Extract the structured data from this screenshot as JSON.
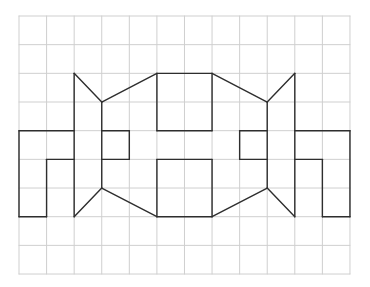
{
  "grid": {
    "cols": 12,
    "rows": 9,
    "origin_px": [
      19,
      16
    ],
    "cell_px": [
      27.58,
      28.67
    ],
    "line_color": "#cfcfcf",
    "line_width": 1
  },
  "figure": {
    "stroke_color": "#2e2e2e",
    "stroke_width": 1.4,
    "segments": [
      [
        [
          0,
          4
        ],
        [
          2,
          4
        ]
      ],
      [
        [
          0,
          4
        ],
        [
          0,
          7
        ]
      ],
      [
        [
          0,
          7
        ],
        [
          1,
          7
        ]
      ],
      [
        [
          1,
          5
        ],
        [
          1,
          7
        ]
      ],
      [
        [
          1,
          5
        ],
        [
          2,
          5
        ]
      ],
      [
        [
          2,
          2
        ],
        [
          2,
          7
        ]
      ],
      [
        [
          2,
          2
        ],
        [
          3,
          3
        ]
      ],
      [
        [
          3,
          3
        ],
        [
          3,
          6
        ]
      ],
      [
        [
          3,
          6
        ],
        [
          2,
          7
        ]
      ],
      [
        [
          3,
          4
        ],
        [
          4,
          4
        ]
      ],
      [
        [
          4,
          4
        ],
        [
          4,
          5
        ]
      ],
      [
        [
          4,
          5
        ],
        [
          3,
          5
        ]
      ],
      [
        [
          3,
          3
        ],
        [
          5,
          2
        ]
      ],
      [
        [
          3,
          6
        ],
        [
          5,
          7
        ]
      ],
      [
        [
          5,
          2
        ],
        [
          7,
          2
        ]
      ],
      [
        [
          5,
          2
        ],
        [
          5,
          4
        ]
      ],
      [
        [
          5,
          4
        ],
        [
          7,
          4
        ]
      ],
      [
        [
          7,
          2
        ],
        [
          7,
          4
        ]
      ],
      [
        [
          5,
          5
        ],
        [
          7,
          5
        ]
      ],
      [
        [
          5,
          5
        ],
        [
          5,
          7
        ]
      ],
      [
        [
          5,
          7
        ],
        [
          7,
          7
        ]
      ],
      [
        [
          7,
          5
        ],
        [
          7,
          7
        ]
      ],
      [
        [
          7,
          2
        ],
        [
          9,
          3
        ]
      ],
      [
        [
          7,
          7
        ],
        [
          9,
          6
        ]
      ],
      [
        [
          9,
          4
        ],
        [
          8,
          4
        ]
      ],
      [
        [
          8,
          4
        ],
        [
          8,
          5
        ]
      ],
      [
        [
          8,
          5
        ],
        [
          9,
          5
        ]
      ],
      [
        [
          9,
          3
        ],
        [
          9,
          6
        ]
      ],
      [
        [
          9,
          3
        ],
        [
          10,
          2
        ]
      ],
      [
        [
          10,
          2
        ],
        [
          10,
          7
        ]
      ],
      [
        [
          9,
          6
        ],
        [
          10,
          7
        ]
      ],
      [
        [
          10,
          4
        ],
        [
          12,
          4
        ]
      ],
      [
        [
          12,
          4
        ],
        [
          12,
          7
        ]
      ],
      [
        [
          12,
          7
        ],
        [
          11,
          7
        ]
      ],
      [
        [
          11,
          7
        ],
        [
          11,
          5
        ]
      ],
      [
        [
          11,
          5
        ],
        [
          10,
          5
        ]
      ]
    ]
  }
}
